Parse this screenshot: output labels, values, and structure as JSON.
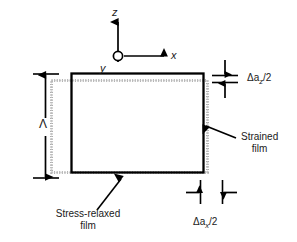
{
  "figure": {
    "type": "schematic-diagram",
    "background_color": "#ffffff",
    "solid_outline_color": "#000000",
    "stippled_outline_color": "#9a9a9a"
  },
  "axes": {
    "vertical_label": "z",
    "horizontal_label": "x",
    "out_of_page_label": "y",
    "origin_marker": "open-circle"
  },
  "dimensions": {
    "period": {
      "label": "Λ",
      "orientation": "vertical",
      "style": "double-headed-arrow-with-end-caps"
    },
    "vertical_gap": {
      "prefix": "Δa",
      "subscript": "z",
      "suffix": "/2",
      "full_label": "Δa_z/2",
      "orientation": "vertical",
      "style": "opposing-arrows-between-tick-lines"
    },
    "horizontal_gap": {
      "prefix": "Δa",
      "subscript": "x",
      "suffix": "/2",
      "full_label": "Δa_x/2",
      "orientation": "horizontal",
      "style": "opposing-arrows-between-tick-lines"
    }
  },
  "callouts": [
    {
      "id": "strained-film",
      "line1": "Strained",
      "line2": "film",
      "pointer": "arrow-to-upper-left"
    },
    {
      "id": "stress-relaxed-film",
      "line1": "Stress-relaxed",
      "line2": "film",
      "pointer": "arrow-to-upper-right"
    }
  ]
}
